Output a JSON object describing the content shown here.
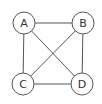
{
  "diagram": {
    "type": "graph",
    "nodes": [
      {
        "id": "A",
        "label": "A",
        "x": 24,
        "y": 23
      },
      {
        "id": "B",
        "label": "B",
        "x": 83,
        "y": 23
      },
      {
        "id": "C",
        "label": "C",
        "x": 23,
        "y": 84
      },
      {
        "id": "D",
        "label": "D",
        "x": 82,
        "y": 84
      }
    ],
    "edges": [
      {
        "from": "A",
        "to": "B"
      },
      {
        "from": "A",
        "to": "C"
      },
      {
        "from": "A",
        "to": "D"
      },
      {
        "from": "B",
        "to": "C"
      },
      {
        "from": "B",
        "to": "D"
      },
      {
        "from": "C",
        "to": "D"
      }
    ],
    "node_radius": 11,
    "stroke_color": "#555555"
  }
}
